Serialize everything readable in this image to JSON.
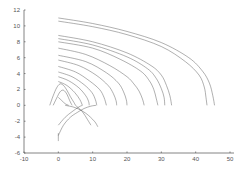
{
  "chart_data": {
    "type": "line",
    "title": "",
    "xlabel": "",
    "ylabel": "",
    "xlim": [
      -10,
      50
    ],
    "ylim": [
      -6,
      12
    ],
    "xticks": [
      -10,
      0,
      10,
      20,
      30,
      40,
      50
    ],
    "yticks": [
      -6,
      -4,
      -2,
      0,
      2,
      4,
      6,
      8,
      10,
      12
    ],
    "grid": false,
    "legend": null,
    "colors": {
      "line": "#555555",
      "axis": "#666666",
      "background": "#ffffff"
    },
    "series": [
      {
        "name": "traj-1",
        "x": [
          0,
          10,
          20,
          30,
          38,
          42,
          44,
          45,
          45.5
        ],
        "y": [
          11.0,
          10.3,
          9.3,
          7.9,
          6.0,
          4.3,
          2.8,
          1.2,
          0
        ]
      },
      {
        "name": "traj-2",
        "x": [
          0,
          10,
          20,
          30,
          37,
          41,
          42.5,
          43,
          43.3
        ],
        "y": [
          10.6,
          9.9,
          8.9,
          7.4,
          5.5,
          3.8,
          2.3,
          1.0,
          0
        ]
      },
      {
        "name": "traj-3",
        "x": [
          0,
          10,
          20,
          27,
          30,
          31.5,
          32.5,
          33
        ],
        "y": [
          8.8,
          8.0,
          6.6,
          5.0,
          3.8,
          2.5,
          1.2,
          0
        ]
      },
      {
        "name": "traj-4",
        "x": [
          0,
          10,
          20,
          26,
          28.5,
          30,
          30.8,
          31
        ],
        "y": [
          8.4,
          7.6,
          6.1,
          4.6,
          3.4,
          2.1,
          1.0,
          0
        ]
      },
      {
        "name": "traj-5",
        "x": [
          0,
          10,
          18,
          24,
          26.5,
          27.8,
          28.5,
          29
        ],
        "y": [
          8.0,
          7.2,
          5.8,
          4.3,
          3.1,
          2.0,
          0.9,
          0
        ]
      },
      {
        "name": "traj-6",
        "x": [
          0,
          8,
          15,
          20,
          22,
          23.5,
          24.5,
          25
        ],
        "y": [
          7.2,
          6.4,
          5.0,
          3.6,
          2.7,
          1.8,
          0.8,
          0
        ]
      },
      {
        "name": "traj-7",
        "x": [
          0,
          8,
          14,
          17.5,
          19,
          19.8,
          20
        ],
        "y": [
          6.3,
          5.5,
          4.1,
          2.8,
          1.7,
          0.7,
          0
        ]
      },
      {
        "name": "traj-8",
        "x": [
          0,
          6,
          11,
          14.5,
          16,
          16.8,
          17
        ],
        "y": [
          5.7,
          5.0,
          3.8,
          2.5,
          1.5,
          0.6,
          0
        ]
      },
      {
        "name": "traj-9",
        "x": [
          0,
          5,
          9,
          12,
          13.3,
          14
        ],
        "y": [
          4.9,
          4.2,
          3.1,
          2.0,
          1.0,
          0
        ]
      },
      {
        "name": "traj-10",
        "x": [
          0,
          4,
          7.5,
          9.8,
          10.8,
          11.2
        ],
        "y": [
          4.2,
          3.6,
          2.6,
          1.6,
          0.7,
          0
        ]
      },
      {
        "name": "traj-11",
        "x": [
          0,
          3,
          6,
          8,
          8.8,
          9
        ],
        "y": [
          3.6,
          3.1,
          2.2,
          1.2,
          0.5,
          0
        ]
      },
      {
        "name": "traj-12",
        "x": [
          0,
          2.5,
          4.8,
          6.3,
          7
        ],
        "y": [
          3.0,
          2.5,
          1.6,
          0.7,
          0
        ]
      },
      {
        "name": "traj-13",
        "x": [
          -2.5,
          -1.5,
          -0.5,
          0.5,
          1.5,
          2.5,
          3.5,
          4.5,
          5
        ],
        "y": [
          0,
          1.2,
          2.2,
          2.7,
          2.5,
          1.9,
          1.1,
          0.4,
          0
        ]
      },
      {
        "name": "traj-14",
        "x": [
          -1.5,
          -0.5,
          0.5,
          1.5,
          2.5,
          3.3,
          4
        ],
        "y": [
          0,
          0.9,
          1.7,
          1.9,
          1.4,
          0.6,
          0
        ]
      },
      {
        "name": "traj-15",
        "x": [
          2,
          5,
          8,
          10.5,
          11.5
        ],
        "y": [
          0,
          -0.3,
          -1.0,
          -2.0,
          -2.7
        ]
      },
      {
        "name": "traj-16",
        "x": [
          5,
          7,
          8.5,
          9.5
        ],
        "y": [
          0,
          -0.8,
          -1.8,
          -2.5
        ]
      },
      {
        "name": "traj-17",
        "x": [
          0,
          2,
          4,
          6,
          7
        ],
        "y": [
          -2.5,
          -1.5,
          -0.8,
          -0.2,
          0
        ]
      },
      {
        "name": "traj-18",
        "x": [
          0,
          1.5,
          3.5,
          5.5,
          7.5,
          9.5,
          11
        ],
        "y": [
          -3.8,
          -2.5,
          -1.5,
          -0.9,
          -0.4,
          -0.1,
          0
        ]
      },
      {
        "name": "traj-19",
        "x": [
          0,
          0,
          0
        ],
        "y": [
          -4.5,
          -4.0,
          -3.5
        ]
      },
      {
        "name": "traj-20",
        "x": [
          0,
          1,
          2,
          3
        ],
        "y": [
          1.0,
          0.6,
          0.2,
          0
        ]
      }
    ]
  }
}
